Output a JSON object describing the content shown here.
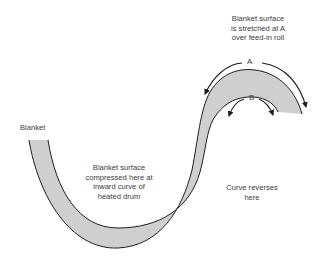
{
  "diagram": {
    "labels": {
      "blanket": "Blanket",
      "stretched": [
        "Blanket surface",
        "is stretched at A",
        "over feed-in roll"
      ],
      "compressed": [
        "Blanket surface",
        "compressed here at",
        "inward curve of",
        "heated drum"
      ],
      "reverses": [
        "Curve reverses",
        "here"
      ],
      "point_a": "A",
      "point_b": "B"
    },
    "colors": {
      "band_fill": "#cfcfcf",
      "outline": "#1e1e1e",
      "text": "#3a3a3a",
      "background": "#ffffff"
    }
  }
}
